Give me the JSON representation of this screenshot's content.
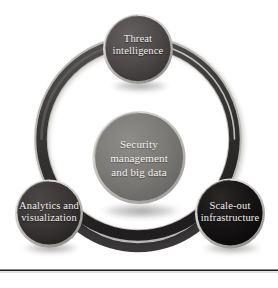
{
  "figure": {
    "background_color": "#ffffff",
    "width": 278,
    "height": 288
  },
  "ring": {
    "name": "connecting-ring",
    "color": "#3b3b3b",
    "highlight_color": "#8c8c8c",
    "shadow_color": "#bdbdbd"
  },
  "center_node": {
    "label_lines": [
      "Security",
      "management",
      "and big data"
    ],
    "label": "Security management and big data",
    "fill_color": "#7b7b7b",
    "rim_color": "#c9c7c2",
    "text_color": "#f4f2ef"
  },
  "nodes": [
    {
      "id": "threat-intelligence",
      "label_lines": [
        "Threat",
        "intelligence"
      ],
      "label": "Threat intelligence",
      "position": "top",
      "fill_color": "#4f4c4c",
      "rim_color": "#d6d4cf",
      "text_color": "#f2f0ec"
    },
    {
      "id": "analytics-and-visualization",
      "label_lines": [
        "Analytics and",
        "visualization"
      ],
      "label": "Analytics and visualization",
      "position": "bottom-left",
      "fill_color": "#3a3737",
      "rim_color": "#d2d0cb",
      "text_color": "#f2f0ec"
    },
    {
      "id": "scale-out-infrastructure",
      "label_lines": [
        "Scale-out",
        "infrastructure"
      ],
      "label": "Scale-out infrastructure",
      "position": "bottom-right",
      "fill_color": "#151313",
      "rim_color": "#cfcdc8",
      "text_color": "#f4f2ef"
    }
  ],
  "footer_rule": {
    "name": "horizontal-rule",
    "color": "#1a1a1a"
  }
}
